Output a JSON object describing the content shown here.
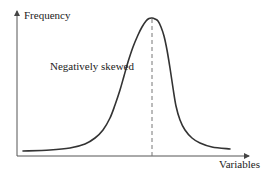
{
  "chart_data": {
    "type": "line",
    "title": "",
    "xlabel": "Variables",
    "ylabel": "Frequency",
    "annotations": [
      {
        "text": "Negatively skewed",
        "position": "left of peak, mid-height"
      }
    ],
    "series": [
      {
        "name": "distribution curve",
        "description": "Unimodal curve with long left tail; dashed vertical line marks the peak (mode)",
        "points_px": [
          [
            23,
            151
          ],
          [
            50,
            150
          ],
          [
            70,
            148
          ],
          [
            85,
            144
          ],
          [
            95,
            138
          ],
          [
            103,
            130
          ],
          [
            110,
            118
          ],
          [
            115,
            105
          ],
          [
            120,
            90
          ],
          [
            124,
            76
          ],
          [
            128,
            62
          ],
          [
            133,
            47
          ],
          [
            138,
            35
          ],
          [
            142,
            27
          ],
          [
            146,
            21
          ],
          [
            149,
            18.5
          ],
          [
            152,
            18
          ],
          [
            155,
            19
          ],
          [
            158,
            21
          ],
          [
            161,
            27
          ],
          [
            164,
            36
          ],
          [
            167,
            50
          ],
          [
            170,
            68
          ],
          [
            173,
            88
          ],
          [
            176,
            106
          ],
          [
            180,
            120
          ],
          [
            185,
            130
          ],
          [
            192,
            138
          ],
          [
            200,
            143
          ],
          [
            212,
            147
          ],
          [
            230,
            149
          ]
        ]
      }
    ],
    "mode_marker": {
      "x_px": 152,
      "style": "dashed"
    },
    "grid": false,
    "legend": null,
    "colors": {
      "curve": "#333333",
      "axes": "#555555",
      "dashed_line": "#777777"
    }
  },
  "labels": {
    "y_axis": "Frequency",
    "x_axis": "Variables",
    "annotation": "Negatively skewed"
  }
}
